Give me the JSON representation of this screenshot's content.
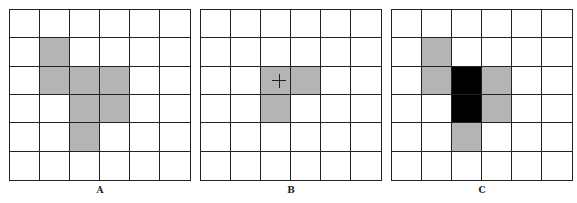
{
  "figure": {
    "grid_rows": 6,
    "grid_cols": 6,
    "colors": {
      "gray": "#b4b4b4",
      "black": "#000000",
      "line": "#222222",
      "background": "#ffffff"
    },
    "panels": [
      {
        "id": "A",
        "label": "A",
        "left": 9,
        "gray_cells": [
          [
            1,
            1
          ],
          [
            2,
            1
          ],
          [
            2,
            2
          ],
          [
            2,
            3
          ],
          [
            3,
            2
          ],
          [
            3,
            3
          ],
          [
            4,
            2
          ]
        ],
        "black_cells": [],
        "markers": []
      },
      {
        "id": "B",
        "label": "B",
        "left": 200,
        "gray_cells": [
          [
            2,
            2
          ],
          [
            2,
            3
          ],
          [
            3,
            2
          ]
        ],
        "black_cells": [],
        "markers": [
          {
            "type": "crosshair",
            "row": 2,
            "col": 2,
            "offset_x": 11,
            "offset_y": 7
          }
        ]
      },
      {
        "id": "C",
        "label": "C",
        "left": 391,
        "gray_cells": [
          [
            1,
            1
          ],
          [
            2,
            1
          ],
          [
            2,
            3
          ],
          [
            3,
            3
          ],
          [
            4,
            2
          ]
        ],
        "black_cells": [
          [
            2,
            2
          ],
          [
            3,
            2
          ]
        ],
        "markers": []
      }
    ]
  }
}
